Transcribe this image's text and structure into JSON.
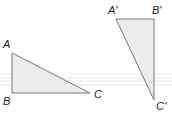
{
  "diagram": {
    "type": "geometry-rotation",
    "colors": {
      "fill": "#ececec",
      "stroke": "#777777",
      "label": "#222222",
      "guide": "#e2e2e2"
    },
    "triangle_original": {
      "labels": {
        "A": "A",
        "B": "B",
        "C": "C"
      }
    },
    "triangle_image": {
      "labels": {
        "A": "A'",
        "B": "B'",
        "C": "C'"
      }
    }
  }
}
